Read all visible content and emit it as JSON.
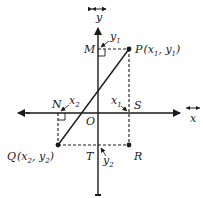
{
  "diagram": {
    "type": "coordinate-geometry",
    "colors": {
      "ink": "#1a1a1a",
      "background": "#ffffff"
    },
    "axes": {
      "x_label": "x",
      "y_label": "y",
      "origin_label": "O"
    },
    "points": {
      "P": {
        "label": "P",
        "coords": "(x₁, y₁)",
        "name": "P",
        "x1": "x",
        "sub1": "1",
        "y1": "y",
        "sub2": "1"
      },
      "Q": {
        "label": "Q",
        "name": "Q",
        "x1": "x",
        "sub1": "2",
        "y1": "y",
        "sub2": "2"
      },
      "R": {
        "label": "R"
      },
      "S": {
        "label": "S"
      },
      "T": {
        "label": "T"
      },
      "M": {
        "label": "M"
      },
      "N": {
        "label": "N"
      }
    },
    "distance_labels": {
      "y1": {
        "main": "y",
        "sub": "1"
      },
      "y2": {
        "main": "y",
        "sub": "2"
      },
      "x1": {
        "main": "x",
        "sub": "1"
      },
      "x2": {
        "main": "x",
        "sub": "2"
      }
    },
    "segments": [
      {
        "from": "P",
        "to": "Q",
        "style": "solid"
      },
      {
        "from": "M",
        "to": "P",
        "style": "dashed"
      },
      {
        "from": "P",
        "to": "R",
        "style": "dashed"
      },
      {
        "from": "Q",
        "to": "R",
        "style": "dashed"
      },
      {
        "from": "N",
        "to": "Q",
        "style": "dashed"
      }
    ]
  }
}
